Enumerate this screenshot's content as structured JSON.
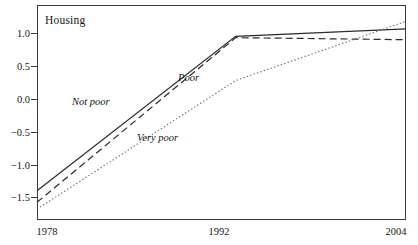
{
  "chart_data": {
    "type": "line",
    "title": "Housing",
    "xlabel": "",
    "ylabel": "",
    "x": [
      1978,
      1992,
      2004
    ],
    "xlim": [
      1978,
      2004
    ],
    "ylim": [
      -1.78,
      1.38
    ],
    "grid": false,
    "legend_position": "inline-annotations",
    "xticks": [
      1978,
      1992,
      2004
    ],
    "xtick_labels": [
      "1978",
      "1992",
      "2004"
    ],
    "yticks": [
      1.0,
      0.5,
      0.0,
      -0.5,
      -1.0,
      -1.5
    ],
    "ytick_labels": [
      "1.0",
      "0.5",
      "0.0",
      "-0.5",
      "-1.0",
      "-1.5"
    ],
    "series": [
      {
        "name": "Not poor",
        "style": "solid",
        "values": [
          -1.35,
          0.92,
          1.03
        ]
      },
      {
        "name": "Poor",
        "style": "dashed",
        "values": [
          -1.52,
          0.9,
          0.87
        ]
      },
      {
        "name": "Very poor",
        "style": "dotted",
        "values": [
          -1.62,
          0.27,
          1.14
        ]
      }
    ],
    "annotations": [
      {
        "text": "Not poor",
        "x": 1982.4,
        "y": -0.05
      },
      {
        "text": "Poor",
        "x": 1989.6,
        "y": 0.33
      },
      {
        "text": "Very poor",
        "x": 1986.3,
        "y": -0.55
      }
    ],
    "colors": {
      "axis": "#3a3a3a",
      "text": "#161616",
      "not_poor": "#2b2b2b",
      "poor": "#2b2b2b",
      "very_poor": "#6a6a6a",
      "background": "#ffffff"
    }
  },
  "axes": {
    "yticks": [
      {
        "label": "1.0",
        "top": 33
      },
      {
        "label": "0.5",
        "top": 66
      },
      {
        "label": "0.0",
        "top": 99
      },
      {
        "label": "-0.5",
        "top": 132
      },
      {
        "label": "-1.0",
        "top": 165
      },
      {
        "label": "-1.5",
        "top": 197
      }
    ],
    "xticks": [
      {
        "label": "1978",
        "left": 47
      },
      {
        "label": "1992",
        "left": 219
      },
      {
        "label": "2004",
        "left": 396
      }
    ]
  }
}
